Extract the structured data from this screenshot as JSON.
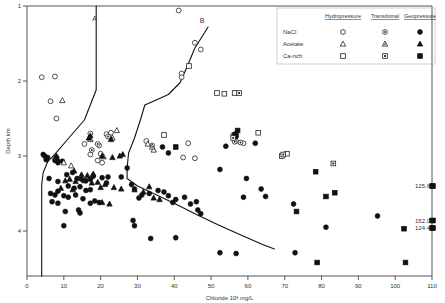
{
  "chart_data": {
    "type": "scatter",
    "title": "",
    "xlabel": "Chloride 10³ mg/L",
    "ylabel": "Depth km",
    "xlim": [
      0,
      110
    ],
    "ylim": [
      1,
      4.6
    ],
    "y_inverted": true,
    "grid": false,
    "xticks": [
      0,
      10,
      20,
      30,
      40,
      50,
      60,
      70,
      80,
      90,
      100,
      110
    ],
    "xticklabels": [
      "0",
      "10",
      "20",
      "30",
      "40",
      "50",
      "60",
      "70",
      "80",
      "90",
      "100",
      "110"
    ],
    "yticks": [
      1,
      2,
      3,
      4
    ],
    "yticklabels": [
      "1",
      "2",
      "3",
      "4"
    ],
    "legend": {
      "position": "top-right",
      "columns": [
        "Hydropressure",
        "Transitional",
        "Geopressure"
      ],
      "rows": [
        {
          "label": "NaCl",
          "marker": "circle"
        },
        {
          "label": "Acetate",
          "marker": "triangle"
        },
        {
          "label": "Ca-rich",
          "marker": "square"
        }
      ]
    },
    "curves": [
      {
        "name": "A",
        "label": "A",
        "label_xy": [
          18.8,
          1.2
        ],
        "points": [
          [
            18.8,
            1.0
          ],
          [
            18.8,
            2.12
          ],
          [
            15.6,
            2.52
          ],
          [
            11.0,
            2.78
          ],
          [
            8.0,
            2.95
          ],
          [
            5.6,
            3.08
          ],
          [
            4.4,
            3.22
          ],
          [
            4.0,
            3.38
          ],
          [
            4.0,
            4.6
          ]
        ]
      },
      {
        "name": "B",
        "label": "B",
        "label_xy": [
          48.0,
          1.22
        ],
        "points": [
          [
            49.2,
            1.28
          ],
          [
            45.6,
            1.56
          ],
          [
            43.2,
            1.84
          ],
          [
            41.6,
            2.02
          ],
          [
            38.4,
            2.18
          ],
          [
            34.8,
            2.26
          ],
          [
            32.0,
            2.32
          ],
          [
            30.8,
            2.52
          ],
          [
            29.2,
            2.76
          ],
          [
            27.6,
            2.96
          ],
          [
            27.2,
            3.16
          ],
          [
            27.2,
            3.3
          ],
          [
            30.0,
            3.4
          ],
          [
            35.2,
            3.52
          ],
          [
            40.4,
            3.64
          ],
          [
            46.0,
            3.78
          ],
          [
            52.0,
            3.92
          ],
          [
            58.4,
            4.06
          ],
          [
            64.0,
            4.18
          ],
          [
            67.2,
            4.24
          ]
        ]
      }
    ],
    "annotations": [
      {
        "text": "125.6",
        "x": 110,
        "y": 3.4
      },
      {
        "text": "152.0",
        "x": 110,
        "y": 3.86
      },
      {
        "text": "124.4",
        "x": 110,
        "y": 3.96
      }
    ],
    "series": [
      {
        "name": "NaCl Hydropressure",
        "marker": "circle",
        "fill": "open",
        "points": [
          [
            4.0,
            1.95
          ],
          [
            7.6,
            1.94
          ],
          [
            6.4,
            2.27
          ],
          [
            8.0,
            2.5
          ],
          [
            17.2,
            2.7
          ],
          [
            15.6,
            2.84
          ],
          [
            21.6,
            2.71
          ],
          [
            22.8,
            2.69
          ],
          [
            19.6,
            2.86
          ],
          [
            17.2,
            2.98
          ],
          [
            20.0,
            2.97
          ],
          [
            20.4,
            3.09
          ],
          [
            41.2,
            1.06
          ],
          [
            45.6,
            1.49
          ],
          [
            47.2,
            1.58
          ],
          [
            42.0,
            1.9
          ],
          [
            42.0,
            1.95
          ],
          [
            32.4,
            2.8
          ],
          [
            34.0,
            2.86
          ],
          [
            43.8,
            2.83
          ],
          [
            42.4,
            3.02
          ],
          [
            45.6,
            3.03
          ],
          [
            56.0,
            2.72
          ],
          [
            56.8,
            2.8
          ],
          [
            58.8,
            2.83
          ],
          [
            7.6,
            3.03
          ],
          [
            19.2,
            3.06
          ]
        ]
      },
      {
        "name": "NaCl Transitional",
        "marker": "circle",
        "fill": "transitional",
        "points": [
          [
            17.6,
            2.92
          ],
          [
            22.0,
            2.74
          ],
          [
            56.4,
            2.81
          ],
          [
            58.0,
            2.82
          ],
          [
            19.2,
            2.84
          ]
        ]
      },
      {
        "name": "NaCl Geopressure",
        "marker": "circle",
        "fill": "filled",
        "points": [
          [
            4.4,
            2.98
          ],
          [
            4.8,
            3.0
          ],
          [
            5.2,
            3.05
          ],
          [
            5.6,
            3.02
          ],
          [
            7.6,
            3.06
          ],
          [
            8.0,
            3.02
          ],
          [
            8.4,
            3.09
          ],
          [
            9.6,
            3.07
          ],
          [
            6.0,
            3.3
          ],
          [
            8.4,
            3.34
          ],
          [
            10.8,
            3.25
          ],
          [
            12.4,
            3.22
          ],
          [
            13.6,
            3.3
          ],
          [
            14.8,
            3.31
          ],
          [
            16.0,
            3.33
          ],
          [
            17.2,
            3.31
          ],
          [
            18.0,
            3.27
          ],
          [
            20.4,
            3.29
          ],
          [
            11.2,
            3.4
          ],
          [
            12.8,
            3.43
          ],
          [
            14.4,
            3.41
          ],
          [
            16.0,
            3.46
          ],
          [
            17.2,
            3.45
          ],
          [
            6.4,
            3.5
          ],
          [
            7.6,
            3.52
          ],
          [
            8.4,
            3.47
          ],
          [
            10.0,
            3.53
          ],
          [
            11.2,
            3.55
          ],
          [
            13.2,
            3.52
          ],
          [
            15.2,
            3.57
          ],
          [
            6.8,
            3.61
          ],
          [
            8.4,
            3.63
          ],
          [
            17.2,
            3.63
          ],
          [
            18.4,
            3.6
          ],
          [
            19.6,
            3.62
          ],
          [
            10.4,
            3.74
          ],
          [
            14.0,
            3.72
          ],
          [
            14.4,
            3.76
          ],
          [
            10.0,
            3.93
          ],
          [
            21.6,
            3.36
          ],
          [
            22.0,
            3.28
          ],
          [
            25.6,
            3.28
          ],
          [
            27.2,
            3.16
          ],
          [
            28.4,
            3.38
          ],
          [
            29.2,
            3.44
          ],
          [
            31.2,
            3.52
          ],
          [
            30.4,
            3.56
          ],
          [
            33.2,
            3.5
          ],
          [
            35.6,
            3.46
          ],
          [
            37.2,
            3.48
          ],
          [
            38.4,
            3.53
          ],
          [
            39.6,
            3.62
          ],
          [
            40.4,
            3.58
          ],
          [
            42.8,
            3.55
          ],
          [
            44.4,
            3.64
          ],
          [
            46.0,
            3.61
          ],
          [
            46.4,
            3.72
          ],
          [
            47.2,
            3.77
          ],
          [
            28.8,
            3.86
          ],
          [
            29.2,
            3.93
          ],
          [
            33.6,
            4.1
          ],
          [
            40.4,
            4.09
          ],
          [
            36.8,
            2.88
          ],
          [
            38.4,
            2.96
          ],
          [
            52.4,
            3.18
          ],
          [
            54.0,
            2.87
          ],
          [
            59.6,
            3.3
          ],
          [
            63.6,
            3.44
          ],
          [
            64.8,
            3.54
          ],
          [
            58.8,
            3.55
          ],
          [
            72.4,
            3.64
          ],
          [
            72.8,
            4.29
          ],
          [
            52.4,
            4.29
          ],
          [
            56.8,
            4.3
          ],
          [
            81.2,
            3.95
          ],
          [
            95.2,
            3.8
          ],
          [
            56.4,
            2.71
          ],
          [
            56.8,
            2.74
          ],
          [
            62.0,
            2.83
          ]
        ]
      },
      {
        "name": "Acetate Hydropressure",
        "marker": "triangle",
        "fill": "open",
        "points": [
          [
            9.6,
            2.26
          ],
          [
            24.4,
            2.66
          ],
          [
            20.8,
            3.01
          ],
          [
            10.0,
            3.09
          ],
          [
            32.8,
            2.84
          ],
          [
            34.4,
            2.92
          ],
          [
            12.0,
            3.13
          ]
        ]
      },
      {
        "name": "Acetate Transitional",
        "marker": "triangle",
        "fill": "transitional",
        "points": [
          [
            17.2,
            2.78
          ],
          [
            23.2,
            2.76
          ],
          [
            34.0,
            2.88
          ]
        ]
      },
      {
        "name": "Acetate Geopressure",
        "marker": "triangle",
        "fill": "filled",
        "points": [
          [
            16.8,
            2.76
          ],
          [
            17.2,
            2.73
          ],
          [
            22.8,
            2.78
          ],
          [
            8.0,
            3.0
          ],
          [
            8.4,
            3.05
          ],
          [
            20.4,
            3.0
          ],
          [
            23.2,
            3.02
          ],
          [
            25.2,
            3.0
          ],
          [
            26.0,
            2.98
          ],
          [
            12.8,
            3.2
          ],
          [
            14.8,
            3.25
          ],
          [
            16.4,
            3.26
          ],
          [
            18.0,
            3.24
          ],
          [
            10.4,
            3.33
          ],
          [
            11.6,
            3.31
          ],
          [
            13.2,
            3.34
          ],
          [
            15.6,
            3.33
          ],
          [
            17.6,
            3.36
          ],
          [
            19.2,
            3.35
          ],
          [
            9.2,
            3.43
          ],
          [
            12.4,
            3.45
          ],
          [
            20.0,
            3.42
          ],
          [
            21.2,
            3.38
          ],
          [
            23.6,
            3.42
          ],
          [
            25.6,
            3.44
          ],
          [
            29.2,
            3.45
          ],
          [
            31.6,
            3.48
          ],
          [
            33.2,
            3.41
          ],
          [
            20.4,
            3.62
          ],
          [
            22.4,
            3.64
          ],
          [
            34.4,
            3.56
          ],
          [
            36.0,
            3.58
          ],
          [
            56.8,
            2.69
          ]
        ]
      },
      {
        "name": "Ca-rich Hydropressure",
        "marker": "square",
        "fill": "open",
        "points": [
          [
            44.0,
            1.8
          ],
          [
            51.6,
            2.16
          ],
          [
            53.6,
            2.17
          ],
          [
            56.4,
            2.16
          ],
          [
            37.2,
            2.72
          ],
          [
            62.8,
            2.69
          ],
          [
            69.2,
            3.0
          ],
          [
            70.6,
            2.97
          ]
        ]
      },
      {
        "name": "Ca-rich Transitional",
        "marker": "square",
        "fill": "transitional",
        "points": [
          [
            57.6,
            2.16
          ],
          [
            56.0,
            2.76
          ],
          [
            83.2,
            3.1
          ],
          [
            69.6,
            2.98
          ]
        ]
      },
      {
        "name": "Ca-rich Geopressure",
        "marker": "square",
        "fill": "filled",
        "points": [
          [
            40.4,
            2.88
          ],
          [
            57.2,
            2.66
          ],
          [
            78.4,
            3.21
          ],
          [
            81.2,
            3.54
          ],
          [
            83.6,
            3.49
          ],
          [
            73.2,
            3.74
          ],
          [
            78.8,
            4.42
          ],
          [
            102.8,
            4.42
          ],
          [
            102.4,
            3.97
          ],
          [
            110.0,
            3.4
          ],
          [
            110.0,
            3.86
          ],
          [
            110.0,
            3.96
          ]
        ]
      }
    ]
  },
  "figure": {
    "curve_a_label": "A",
    "curve_b_label": "B"
  }
}
